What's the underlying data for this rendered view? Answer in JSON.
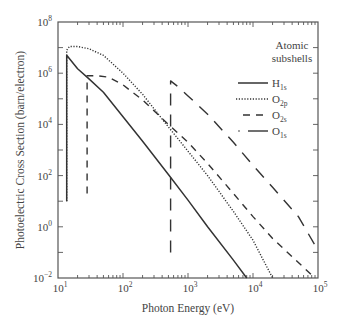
{
  "chart_data": {
    "type": "line",
    "title": "",
    "xlabel": "Photon Energy (eV)",
    "ylabel": "Photoelectric Cross Section (barn/electron)",
    "xscale": "log",
    "yscale": "log",
    "xlim": [
      10,
      100000
    ],
    "ylim": [
      0.01,
      100000000
    ],
    "x_ticks": [
      {
        "base": "10",
        "exp": "1"
      },
      {
        "base": "10",
        "exp": "2"
      },
      {
        "base": "10",
        "exp": "3"
      },
      {
        "base": "10",
        "exp": "4"
      },
      {
        "base": "10",
        "exp": "5"
      }
    ],
    "y_ticks": [
      {
        "base": "10",
        "exp": "8"
      },
      {
        "base": "10",
        "exp": "6"
      },
      {
        "base": "10",
        "exp": "4"
      },
      {
        "base": "10",
        "exp": "2"
      },
      {
        "base": "10",
        "exp": "0"
      },
      {
        "base": "10",
        "exp": "−2"
      }
    ],
    "grid": false,
    "legend": {
      "title_line1": "Atomic",
      "title_line2": "subshells",
      "position": "upper right",
      "entries": [
        {
          "label": "H",
          "sub": "1s",
          "style": "solid"
        },
        {
          "label": "O",
          "sub": "2p",
          "style": "dotted"
        },
        {
          "label": "O",
          "sub": "2s",
          "style": "dashed"
        },
        {
          "label": "O",
          "sub": "1s",
          "style": "dashdot"
        }
      ]
    },
    "series": [
      {
        "name": "H1s",
        "style": "solid",
        "x": [
          13.6,
          13.6,
          20,
          30,
          50,
          100,
          200,
          500,
          1000,
          2000,
          5000,
          8000
        ],
        "y": [
          10,
          5000000,
          1500000,
          600000,
          180000,
          20000,
          2200,
          110,
          11,
          1.0,
          0.05,
          0.01
        ]
      },
      {
        "name": "O2p",
        "style": "dotted",
        "x": [
          13.6,
          13.6,
          15,
          20,
          30,
          50,
          100,
          200,
          500,
          1000,
          2000,
          5000,
          10000,
          20000
        ],
        "y": [
          10,
          8000000,
          11000000,
          11000000,
          9000000,
          5000000,
          1000000,
          150000,
          8000,
          900,
          100,
          4,
          0.3,
          0.01
        ]
      },
      {
        "name": "O2s",
        "style": "dashed",
        "x": [
          28,
          28,
          40,
          60,
          100,
          200,
          500,
          1000,
          2000,
          5000,
          10000,
          20000,
          50000,
          90000
        ],
        "y": [
          20,
          800000,
          800000,
          700000,
          350000,
          90000,
          10000,
          2000,
          300,
          20,
          2.5,
          0.35,
          0.04,
          0.01
        ]
      },
      {
        "name": "O1s",
        "style": "dashdot",
        "x": [
          540,
          540,
          540,
          700,
          1000,
          2000,
          5000,
          10000,
          20000,
          50000,
          100000
        ],
        "y": [
          0.1,
          0.1,
          500000,
          300000,
          130000,
          25000,
          2000,
          250,
          35,
          2.5,
          0.12
        ]
      }
    ]
  }
}
